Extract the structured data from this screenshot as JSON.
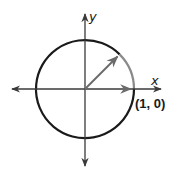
{
  "diagram": {
    "type": "unit-circle",
    "axes": {
      "x_label": "x",
      "y_label": "y"
    },
    "point_label": "(1, 0)",
    "vectors": [
      {
        "name": "initial-vector",
        "angle_deg": 0
      },
      {
        "name": "rotated-vector",
        "angle_deg": 45
      }
    ],
    "highlighted_arc": {
      "from_deg": 0,
      "to_deg": 45
    },
    "colors": {
      "circle": "#1a1a1a",
      "axes": "#3a3a3a",
      "vector": "#6b6b6b",
      "arc_highlight": "#8a8a8a",
      "text": "#1a1a1a"
    }
  }
}
